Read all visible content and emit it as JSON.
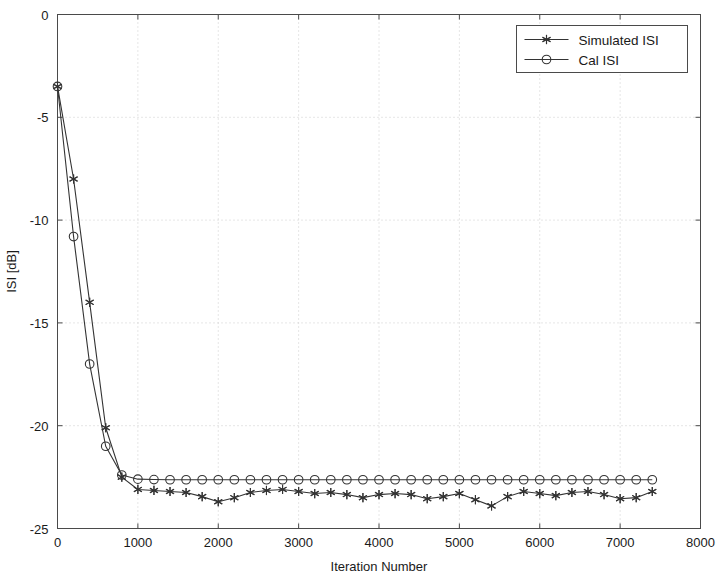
{
  "chart_data": {
    "type": "line",
    "title": "",
    "xlabel": "Iteration Number",
    "ylabel": "ISI [dB]",
    "xlim": [
      0,
      8000
    ],
    "ylim": [
      -25,
      0
    ],
    "xticks": [
      0,
      1000,
      2000,
      3000,
      4000,
      5000,
      6000,
      7000,
      8000
    ],
    "xtick_labels": [
      "0",
      "1000",
      "2000",
      "3000",
      "4000",
      "5000",
      "6000",
      "7000",
      "8000"
    ],
    "yticks": [
      0,
      -5,
      -10,
      -15,
      -20,
      -25
    ],
    "ytick_labels": [
      "0",
      "-5",
      "-10",
      "-15",
      "-20",
      "-25"
    ],
    "grid": true,
    "grid_style": "dotted",
    "grid_color": "#cccccc",
    "legend_position": "top-right",
    "series": [
      {
        "name": "Simulated ISI",
        "marker": "star",
        "color": "#333333",
        "x": [
          0,
          200,
          400,
          600,
          800,
          1000,
          1200,
          1400,
          1600,
          1800,
          2000,
          2200,
          2400,
          2600,
          2800,
          3000,
          3200,
          3400,
          3600,
          3800,
          4000,
          4200,
          4400,
          4600,
          4800,
          5000,
          5200,
          5400,
          5600,
          5800,
          6000,
          6200,
          6400,
          6600,
          6800,
          7000,
          7200,
          7400
        ],
        "values": [
          -3.5,
          -8.0,
          -14.0,
          -20.1,
          -22.5,
          -23.1,
          -23.15,
          -23.2,
          -23.25,
          -23.45,
          -23.7,
          -23.5,
          -23.25,
          -23.15,
          -23.1,
          -23.2,
          -23.3,
          -23.25,
          -23.35,
          -23.5,
          -23.35,
          -23.3,
          -23.35,
          -23.55,
          -23.45,
          -23.3,
          -23.6,
          -23.9,
          -23.45,
          -23.2,
          -23.3,
          -23.4,
          -23.25,
          -23.2,
          -23.35,
          -23.55,
          -23.5,
          -23.2
        ]
      },
      {
        "name": "Cal ISI",
        "marker": "circle",
        "color": "#333333",
        "x": [
          0,
          200,
          400,
          600,
          800,
          1000,
          1200,
          1400,
          1600,
          1800,
          2000,
          2200,
          2400,
          2600,
          2800,
          3000,
          3200,
          3400,
          3600,
          3800,
          4000,
          4200,
          4400,
          4600,
          4800,
          5000,
          5200,
          5400,
          5600,
          5800,
          6000,
          6200,
          6400,
          6600,
          6800,
          7000,
          7200,
          7400
        ],
        "values": [
          -3.5,
          -10.8,
          -17.0,
          -21.0,
          -22.4,
          -22.6,
          -22.62,
          -22.63,
          -22.63,
          -22.63,
          -22.63,
          -22.63,
          -22.63,
          -22.63,
          -22.63,
          -22.63,
          -22.63,
          -22.63,
          -22.63,
          -22.63,
          -22.63,
          -22.63,
          -22.63,
          -22.63,
          -22.63,
          -22.63,
          -22.63,
          -22.63,
          -22.63,
          -22.63,
          -22.63,
          -22.63,
          -22.63,
          -22.63,
          -22.63,
          -22.63,
          -22.63,
          -22.63
        ]
      }
    ]
  },
  "legend": {
    "entries": [
      {
        "label": "Simulated ISI",
        "marker": "star"
      },
      {
        "label": "Cal ISI",
        "marker": "circle"
      }
    ]
  },
  "axes": {
    "x_title": "Iteration Number",
    "y_title": "ISI [dB]"
  }
}
